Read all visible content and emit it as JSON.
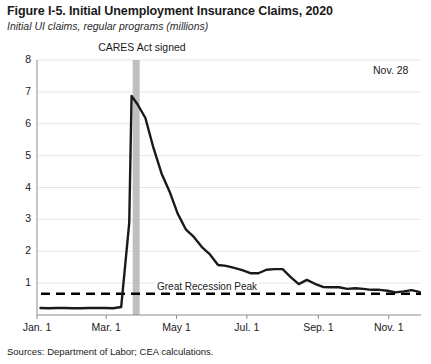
{
  "figure": {
    "title": "Figure I-5. Initial Unemployment Insurance Claims, 2020",
    "subtitle": "Initial UI claims, regular programs (millions)",
    "source": "Sources: Department of Labor; CEA calculations."
  },
  "annotations": {
    "cares_act": "CARES Act signed",
    "last_point": "Nov. 28",
    "reference_line": "Great Recession Peak"
  },
  "colors": {
    "line": "#1a1a1a",
    "grid": "#e6e6e6",
    "axis": "#8c8c8c",
    "marker_bar": "#bfbfbf",
    "reference_dash": "#000000",
    "background": "#ffffff"
  },
  "chart_data": {
    "type": "line",
    "title": "Figure I-5. Initial Unemployment Insurance Claims, 2020",
    "subtitle": "Initial UI claims, regular programs (millions)",
    "xlabel": "",
    "ylabel": "Initial UI claims, regular programs (millions)",
    "ylim": [
      0,
      8
    ],
    "yticks": [
      1,
      2,
      3,
      4,
      5,
      6,
      7,
      8
    ],
    "xticks": [
      "Jan. 1",
      "Mar. 1",
      "May 1",
      "Jul. 1",
      "Sep. 1",
      "Nov. 1"
    ],
    "xtick_days": [
      0,
      60,
      121,
      182,
      244,
      305
    ],
    "xlim_days": [
      0,
      333
    ],
    "grid": true,
    "legend": false,
    "reference_lines": [
      {
        "label": "Great Recession Peak",
        "value": 0.665,
        "style": "dashed"
      }
    ],
    "markers": [
      {
        "label": "CARES Act signed",
        "x_day": 86,
        "style": "vertical-band",
        "color": "#bfbfbf"
      }
    ],
    "series": [
      {
        "name": "Initial UI claims, regular programs (millions)",
        "x_days": [
          3,
          10,
          17,
          24,
          31,
          38,
          45,
          52,
          59,
          66,
          73,
          80,
          82,
          87,
          94,
          101,
          108,
          115,
          122,
          129,
          136,
          143,
          150,
          157,
          164,
          171,
          178,
          185,
          192,
          199,
          206,
          213,
          220,
          227,
          234,
          241,
          248,
          255,
          262,
          269,
          276,
          283,
          290,
          297,
          304,
          311,
          318,
          325,
          332
        ],
        "x_labels": [
          "Jan. 4",
          "Jan. 11",
          "Jan. 18",
          "Jan. 25",
          "Feb. 1",
          "Feb. 8",
          "Feb. 15",
          "Feb. 22",
          "Feb. 29",
          "Mar. 7",
          "Mar. 14",
          "Mar. 21",
          "Mar. 21",
          "Mar. 28",
          "Apr. 4",
          "Apr. 11",
          "Apr. 18",
          "Apr. 25",
          "May 2",
          "May 9",
          "May 16",
          "May 23",
          "May 30",
          "Jun. 6",
          "Jun. 13",
          "Jun. 20",
          "Jun. 27",
          "Jul. 4",
          "Jul. 11",
          "Jul. 18",
          "Jul. 25",
          "Aug. 1",
          "Aug. 8",
          "Aug. 15",
          "Aug. 22",
          "Aug. 29",
          "Sep. 5",
          "Sep. 12",
          "Sep. 19",
          "Sep. 26",
          "Oct. 3",
          "Oct. 10",
          "Oct. 17",
          "Oct. 24",
          "Oct. 31",
          "Nov. 7",
          "Nov. 14",
          "Nov. 21",
          "Nov. 28"
        ],
        "values": [
          0.22,
          0.21,
          0.22,
          0.22,
          0.21,
          0.21,
          0.22,
          0.22,
          0.22,
          0.21,
          0.25,
          2.9,
          6.87,
          6.62,
          6.18,
          5.24,
          4.44,
          3.87,
          3.18,
          2.69,
          2.45,
          2.13,
          1.9,
          1.57,
          1.54,
          1.48,
          1.41,
          1.31,
          1.31,
          1.42,
          1.44,
          1.44,
          1.19,
          0.97,
          1.1,
          0.98,
          0.88,
          0.87,
          0.87,
          0.82,
          0.84,
          0.82,
          0.79,
          0.79,
          0.76,
          0.71,
          0.74,
          0.78,
          0.72
        ]
      }
    ]
  },
  "geometry": {
    "plot_left": 37,
    "plot_right": 421,
    "plot_top": 60,
    "plot_bottom": 315
  }
}
